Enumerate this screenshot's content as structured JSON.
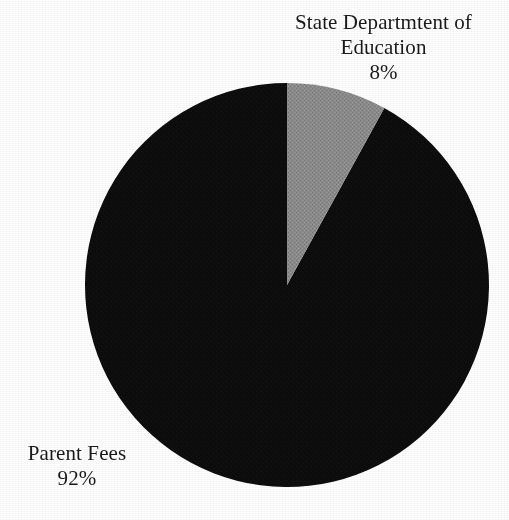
{
  "page": {
    "background_color": "#ffffff",
    "width": 509,
    "height": 520
  },
  "chart_data": {
    "type": "pie",
    "title": "",
    "subtitle": "",
    "xlabel": "",
    "ylabel": "",
    "legend_position": "none",
    "grid": false,
    "units": "percent",
    "start_angle_deg": 0,
    "direction": "clockwise",
    "center": {
      "x": 287,
      "y": 285
    },
    "radius": 202,
    "categories": [
      "State Departmtent of Education",
      "Parent Fees"
    ],
    "values": [
      8,
      92
    ],
    "labels_text": [
      "8%",
      "92%"
    ],
    "colors": [
      "#8a8a8a",
      "#0d0d0d"
    ],
    "slices": [
      {
        "name": "State Departmtent of Education",
        "value": 8,
        "value_text": "8%",
        "color": "#8a8a8a",
        "start_angle_deg": 0,
        "end_angle_deg": 28.8,
        "label_lines": [
          "State Departmtent of",
          "Education"
        ],
        "label_position": "outside-top-right"
      },
      {
        "name": "Parent Fees",
        "value": 92,
        "value_text": "92%",
        "color": "#0d0d0d",
        "start_angle_deg": 28.8,
        "end_angle_deg": 360,
        "label_lines": [
          "Parent Fees"
        ],
        "label_position": "outside-bottom-left"
      }
    ]
  },
  "labels": {
    "state_dept": {
      "line1": "State Departmtent of",
      "line2": "Education",
      "value": "8%"
    },
    "parent_fees": {
      "line1": "Parent Fees",
      "value": "92%"
    }
  },
  "colors": {
    "slice_gray": "#8a8a8a",
    "slice_black": "#0d0d0d",
    "text": "#1a1a1a",
    "background": "#ffffff"
  }
}
